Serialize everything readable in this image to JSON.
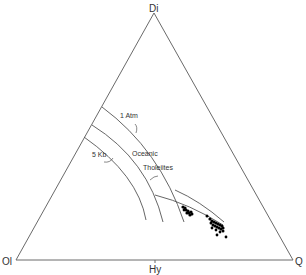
{
  "diagram": {
    "type": "ternary",
    "vertices": {
      "top": "Di",
      "left": "Ol",
      "right": "Q"
    },
    "base_tick_label": "Hy",
    "curve_labels": {
      "one_atm": "1 Atm",
      "five_kb": "5 Kb",
      "oceanic": "Oceanic",
      "tholeiites": "Tholeiites"
    },
    "colors": {
      "line": "#6a6a6a",
      "points": "#000000"
    }
  }
}
